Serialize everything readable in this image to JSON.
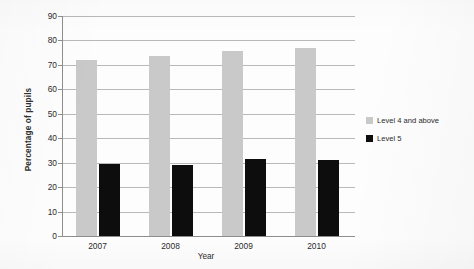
{
  "chart_data": {
    "type": "bar",
    "title": "",
    "xlabel": "Year",
    "ylabel": "Percentage of pupils",
    "categories": [
      "2007",
      "2008",
      "2009",
      "2010"
    ],
    "series": [
      {
        "name": "Level 4 and above",
        "color": "#c9c9c9",
        "values": [
          72,
          73.5,
          75.5,
          77
        ]
      },
      {
        "name": "Level 5",
        "color": "#0d0d0d",
        "values": [
          29.5,
          29,
          31.5,
          31
        ]
      }
    ],
    "ylim": [
      0,
      90
    ],
    "ytick_labels": [
      "90",
      "80",
      "70",
      "60",
      "50",
      "40",
      "30",
      "20",
      "10",
      "0"
    ],
    "ytick_values": [
      90,
      80,
      70,
      60,
      50,
      40,
      30,
      20,
      10,
      0
    ],
    "grid": "horizontal",
    "legend_position": "right"
  }
}
